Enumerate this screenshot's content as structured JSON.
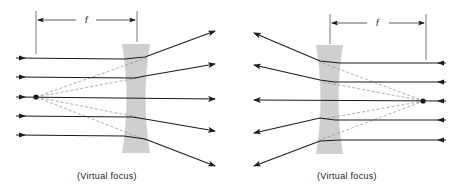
{
  "colors": {
    "ray": "#1a1a1a",
    "virtual_ray": "#8a8a8a",
    "lens": "#cfcfcf",
    "background": "#ffffff"
  },
  "panels": [
    {
      "id": "left",
      "focal_length_label": "f",
      "focus_caption": "(Virtual focus)",
      "lens": {
        "x_left": 122,
        "x_right": 150,
        "y_top": 44,
        "y_bottom": 153
      },
      "focal_point": {
        "x": 36,
        "y": 97
      },
      "dimension": {
        "x1": 36,
        "x2": 137,
        "y": 20
      },
      "incoming_rays_direction": "left-to-right",
      "rays": [
        {
          "y_in": 58,
          "out_end": [
            215,
            31
          ]
        },
        {
          "y_in": 77,
          "out_end": [
            215,
            64
          ]
        },
        {
          "y_in": 97,
          "out_end": [
            215,
            99
          ]
        },
        {
          "y_in": 116,
          "out_end": [
            215,
            131
          ]
        },
        {
          "y_in": 135,
          "out_end": [
            215,
            166
          ]
        }
      ]
    },
    {
      "id": "right",
      "focal_length_label": "f",
      "focus_caption": "(Virtual focus)",
      "lens": {
        "x_left": 316,
        "x_right": 343,
        "y_top": 45,
        "y_bottom": 154
      },
      "focal_point": {
        "x": 424,
        "y": 101
      },
      "dimension": {
        "x1": 330,
        "x2": 426,
        "y": 23
      },
      "incoming_rays_direction": "right-to-left",
      "rays": [
        {
          "y_in": 63,
          "out_end": [
            254,
            33
          ]
        },
        {
          "y_in": 82,
          "out_end": [
            254,
            65
          ]
        },
        {
          "y_in": 101,
          "out_end": [
            254,
            100
          ]
        },
        {
          "y_in": 120,
          "out_end": [
            254,
            133
          ]
        },
        {
          "y_in": 140,
          "out_end": [
            254,
            166
          ]
        }
      ]
    }
  ]
}
